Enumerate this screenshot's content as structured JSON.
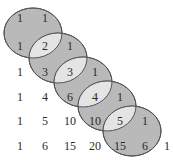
{
  "diagram": {
    "title": "",
    "colors": {
      "ellipse_fill": "#b9b9b9",
      "lens_fill": "#e4e4e4",
      "stroke": "#555555",
      "text": "#2a2a2a",
      "background": "#ffffff"
    },
    "rows": [
      [
        "1",
        "1"
      ],
      [
        "1",
        "2",
        "1"
      ],
      [
        "1",
        "3",
        "3",
        "1"
      ],
      [
        "1",
        "4",
        "6",
        "4",
        "1"
      ],
      [
        "1",
        "5",
        "10",
        "10",
        "5",
        "1"
      ],
      [
        "1",
        "6",
        "15",
        "20",
        "15",
        "6",
        "1"
      ]
    ],
    "ellipses": [
      {
        "cx": 33,
        "cy": 33
      },
      {
        "cx": 58,
        "cy": 58
      },
      {
        "cx": 83,
        "cy": 82
      },
      {
        "cx": 107,
        "cy": 106
      },
      {
        "cx": 132,
        "cy": 131
      }
    ],
    "lens_values": [
      "2",
      "3",
      "4",
      "5"
    ]
  }
}
